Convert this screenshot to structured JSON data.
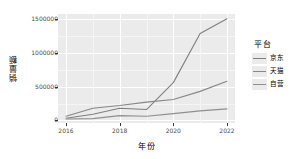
{
  "chart_data": {
    "type": "line",
    "title": "",
    "xlabel": "年份",
    "ylabel": "销量额",
    "x": [
      2016,
      2017,
      2018,
      2019,
      2020,
      2021,
      2022
    ],
    "xlim": [
      2015.7,
      2022.3
    ],
    "ylim": [
      -40000,
      1580000
    ],
    "xticks": [
      "2016",
      "2018",
      "2020",
      "2022"
    ],
    "xtick_values": [
      2016,
      2018,
      2020,
      2022
    ],
    "yticks": [
      "0",
      "500000",
      "1000000",
      "1500000"
    ],
    "ytick_values": [
      0,
      500000,
      1000000,
      1500000
    ],
    "grid": true,
    "legend_position": "right",
    "legend_title": "平台",
    "series": [
      {
        "name": "京东",
        "color": "#7f7f7f",
        "values": [
          30000,
          90000,
          180000,
          160000,
          560000,
          1290000,
          1510000
        ]
      },
      {
        "name": "天猫",
        "color": "#878787",
        "values": [
          60000,
          180000,
          220000,
          270000,
          310000,
          430000,
          580000
        ]
      },
      {
        "name": "自营",
        "color": "#8f8f8f",
        "values": [
          20000,
          25000,
          70000,
          60000,
          100000,
          140000,
          170000
        ]
      }
    ]
  },
  "style": {
    "panel_background": "#ebebeb",
    "grid_major_color": "#ffffff",
    "grid_minor_color": "#f5f5f5",
    "axis_text_color": "#4d4d4d",
    "axis_title_color": "#000000",
    "page_background": "#ffffff"
  }
}
